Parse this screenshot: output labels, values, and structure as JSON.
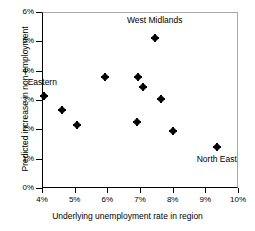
{
  "chart_data": {
    "type": "scatter",
    "title": "",
    "xlabel": "Underlying unemployment rate in region",
    "ylabel": "Predicted increase in non-employment",
    "xlim": [
      4,
      10
    ],
    "ylim": [
      0,
      6
    ],
    "xticks": [
      "4%",
      "5%",
      "6%",
      "7%",
      "8%",
      "9%",
      "10%"
    ],
    "xtick_values": [
      4,
      5,
      6,
      7,
      8,
      9,
      10
    ],
    "yticks": [
      "0%",
      "1%",
      "2%",
      "3%",
      "4%",
      "5%",
      "6%"
    ],
    "ytick_values": [
      0,
      1,
      2,
      3,
      4,
      5,
      6
    ],
    "grid": false,
    "legend": null,
    "marker_color": "#000000",
    "points": [
      {
        "x": 4.05,
        "y": 3.15,
        "label": "Eastern"
      },
      {
        "x": 4.6,
        "y": 2.67,
        "label": ""
      },
      {
        "x": 5.07,
        "y": 2.15,
        "label": ""
      },
      {
        "x": 5.93,
        "y": 3.8,
        "label": ""
      },
      {
        "x": 6.9,
        "y": 2.25,
        "label": ""
      },
      {
        "x": 6.95,
        "y": 3.8,
        "label": ""
      },
      {
        "x": 7.1,
        "y": 3.45,
        "label": ""
      },
      {
        "x": 7.45,
        "y": 5.12,
        "label": "West Midlands"
      },
      {
        "x": 7.65,
        "y": 3.03,
        "label": ""
      },
      {
        "x": 8.0,
        "y": 1.95,
        "label": ""
      },
      {
        "x": 9.35,
        "y": 1.4,
        "label": "North East"
      }
    ],
    "annotations": [
      {
        "text": "West Midlands",
        "x": 7.45,
        "y": 5.7,
        "align": "center"
      },
      {
        "text": "Eastern",
        "x": 4.05,
        "y": 3.58,
        "align": "left"
      },
      {
        "text": "North East",
        "x": 9.35,
        "y": 0.95,
        "align": "center"
      }
    ]
  }
}
